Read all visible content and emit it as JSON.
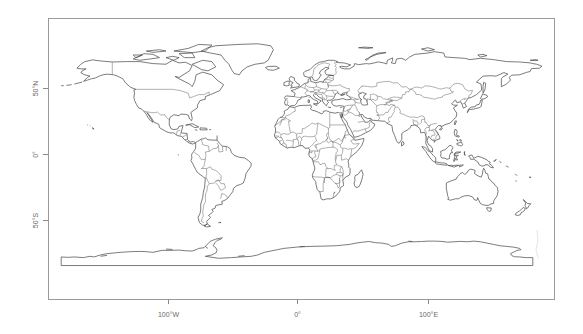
{
  "map": {
    "type": "world country outline map",
    "projection": "equirectangular (longitude/latitude)",
    "line_color": "#4a4a4a",
    "frame_color": "#9a9a9a",
    "background": "#ffffff",
    "x_axis": {
      "ticks": [
        {
          "value": -100,
          "label": "100°W"
        },
        {
          "value": 0,
          "label": "0°"
        },
        {
          "value": 100,
          "label": "100°E"
        }
      ]
    },
    "y_axis": {
      "ticks": [
        {
          "value": 50,
          "label": "50°N"
        },
        {
          "value": 0,
          "label": "0°"
        },
        {
          "value": -50,
          "label": "50°S"
        }
      ]
    },
    "extent": {
      "lon": [
        -180,
        190
      ],
      "lat": [
        -90,
        85
      ]
    },
    "regions_shown": [
      "North America",
      "South America",
      "Europe",
      "Africa",
      "Asia",
      "Australia",
      "Antarctica",
      "Greenland",
      "New Zealand"
    ]
  }
}
